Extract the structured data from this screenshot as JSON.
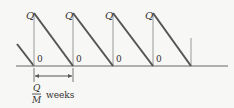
{
  "diagram": {
    "peak_label": "Q",
    "zero_label": "0",
    "interval": {
      "numerator": "Q",
      "denominator": "M",
      "unit": "weeks"
    },
    "colors": {
      "line": "#555555",
      "axis": "#666666",
      "background": "#f7f7f5"
    }
  }
}
